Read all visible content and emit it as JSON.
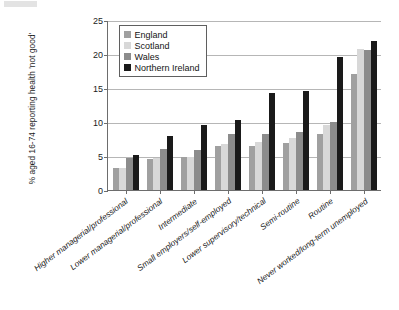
{
  "chart_data": {
    "type": "bar",
    "title": "",
    "subtitle": "",
    "xlabel": "",
    "ylabel": "% aged 16-74 reporting health 'not good'",
    "ylim": [
      0,
      25
    ],
    "yticks": [
      0,
      5,
      10,
      15,
      20,
      25
    ],
    "ytick_labels": [
      "0",
      "5",
      "10",
      "15",
      "20",
      "25"
    ],
    "grid": true,
    "legend_position": "top-left-inside",
    "categories": [
      "Higher managerial/professional",
      "Lower managerial/professional",
      "Intermediate",
      "Small employers/self-employed",
      "Lower supervisory/technical",
      "Semi-routine",
      "Routine",
      "Never worked/long-term unemployed"
    ],
    "series": [
      {
        "name": "England",
        "color": "#a0a0a0",
        "values": [
          3.3,
          4.6,
          4.9,
          6.5,
          6.5,
          6.9,
          8.2,
          17.0
        ]
      },
      {
        "name": "Scotland",
        "color": "#d8d8d8",
        "values": [
          3.3,
          4.7,
          4.9,
          6.7,
          7.1,
          7.6,
          9.5,
          20.8
        ]
      },
      {
        "name": "Wales",
        "color": "#8c8c8c",
        "values": [
          4.7,
          6.0,
          5.9,
          8.3,
          8.3,
          8.5,
          10.0,
          20.6
        ]
      },
      {
        "name": "Northern Ireland",
        "color": "#1a1a1a",
        "values": [
          5.2,
          8.0,
          9.6,
          10.3,
          14.3,
          14.5,
          19.5,
          21.9
        ]
      }
    ]
  }
}
